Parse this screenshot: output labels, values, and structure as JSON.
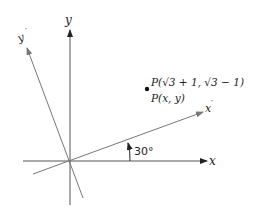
{
  "diagram": {
    "axes": {
      "x_label": "x",
      "y_label": "y",
      "x_prime_label": "x",
      "x_prime_mark": "′",
      "y_prime_label": "y",
      "y_prime_mark": "′"
    },
    "angle": {
      "label": "30°",
      "degrees": 30
    },
    "point": {
      "label_rotated": "P(√3 + 1, √3 − 1)",
      "label_original": "P(x, y)"
    },
    "colors": {
      "axis_black": "#222222",
      "axis_gray": "#777777"
    }
  }
}
